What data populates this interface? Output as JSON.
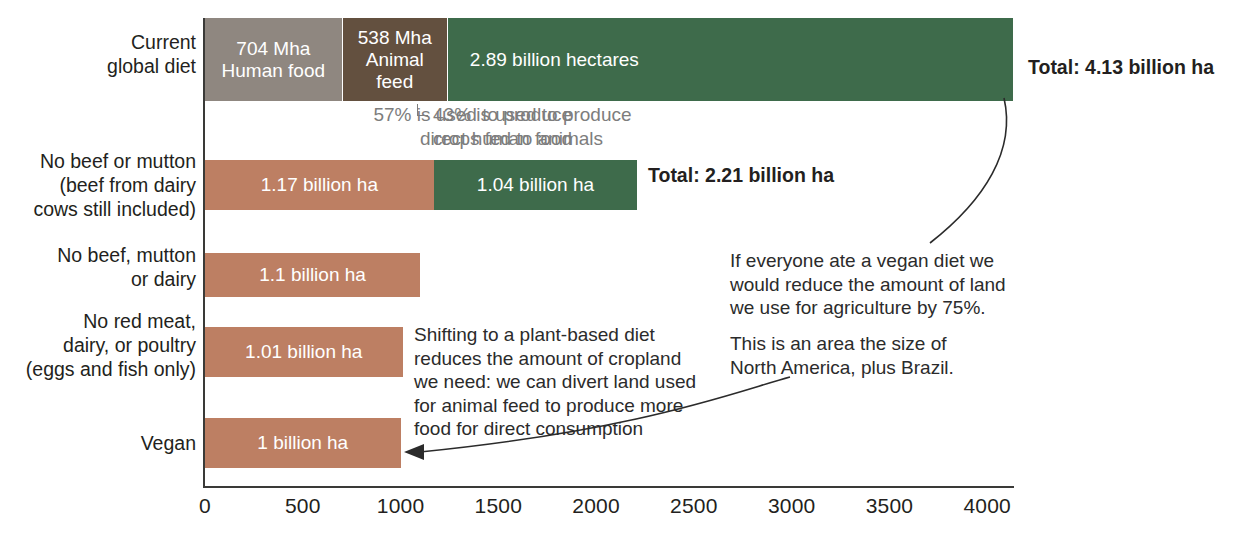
{
  "chart_data": {
    "type": "bar",
    "orientation": "horizontal",
    "stacked": true,
    "title": "",
    "xlabel": "",
    "ylabel": "",
    "xlim": [
      0,
      4150
    ],
    "grid": false,
    "legend": "none",
    "unit": "Mha",
    "categories": [
      "Current\nglobal diet",
      "No beef or mutton\n(beef from dairy\ncows still included)",
      "No beef, mutton\nor dairy",
      "No red meat,\ndairy, or poultry\n(eggs and fish only)",
      "Vegan"
    ],
    "series": [
      {
        "name": "Human food cropland",
        "values": [
          704,
          1170,
          1100,
          1010,
          1000
        ]
      },
      {
        "name": "Animal feed cropland",
        "values": [
          538,
          0,
          0,
          0,
          0
        ]
      },
      {
        "name": "Pasture / grazing land",
        "values": [
          2890,
          1040,
          0,
          0,
          0
        ]
      }
    ],
    "totals": [
      4130,
      2210,
      1100,
      1010,
      1000
    ],
    "tick_labels": [
      "0",
      "500",
      "1000",
      "1500",
      "2000",
      "2500",
      "3000",
      "3500",
      "4000"
    ],
    "tick_values": [
      0,
      500,
      1000,
      1500,
      2000,
      2500,
      3000,
      3500,
      4000
    ]
  },
  "colors": {
    "human_food_grey": "#8f8780",
    "animal_feed_brown": "#63503f",
    "pasture_green": "#3e6b4b",
    "cropland_tan": "#bd7f63",
    "axis": "#3a3a38",
    "grey_text": "#7d7d7d",
    "dark_text": "#231f20",
    "bar_label_text": "#ffffff"
  },
  "bars": [
    {
      "category": "Current\nglobal diet",
      "segments": [
        {
          "label": "704 Mha\nHuman food",
          "value": 704,
          "color": "#8f8780"
        },
        {
          "label": "538 Mha\nAnimal\nfeed",
          "value": 538,
          "color": "#63503f"
        },
        {
          "label": "2.89 billion hectares",
          "value": 2890,
          "color": "#3e6b4b"
        }
      ],
      "total_label": "Total: 4.13 billion ha"
    },
    {
      "category": "No beef or mutton\n(beef from dairy\ncows still included)",
      "segments": [
        {
          "label": "1.17 billion ha",
          "value": 1170,
          "color": "#bd7f63"
        },
        {
          "label": "1.04 billion ha",
          "value": 1040,
          "color": "#3e6b4b"
        }
      ],
      "total_label": "Total: 2.21 billion ha"
    },
    {
      "category": "No beef, mutton\nor dairy",
      "segments": [
        {
          "label": "1.1 billion ha",
          "value": 1100,
          "color": "#bd7f63"
        }
      ],
      "total_label": ""
    },
    {
      "category": "No red meat,\ndairy, or poultry\n(eggs and fish only)",
      "segments": [
        {
          "label": "1.01 billion ha",
          "value": 1010,
          "color": "#bd7f63"
        }
      ],
      "total_label": ""
    },
    {
      "category": "Vegan",
      "segments": [
        {
          "label": "1 billion ha",
          "value": 1000,
          "color": "#bd7f63"
        }
      ],
      "total_label": ""
    }
  ],
  "annotations": {
    "left_share": "57% is used to produce\ndirect human food",
    "right_share": "43% is used to produce\ncrops fed to animals",
    "shift_note": "Shifting to a plant-based diet\nreduces the amount of cropland\nwe need: we can divert land used\nfor animal feed to produce more\nfood for direct consumption",
    "vegan_note": "If everyone ate a vegan diet we\nwould reduce the amount of land\nwe use for agriculture by 75%.",
    "area_note": "This is an area the size of\nNorth America, plus Brazil."
  },
  "axis": {
    "ticks": [
      "0",
      "500",
      "1000",
      "1500",
      "2000",
      "2500",
      "3000",
      "3500",
      "4000"
    ]
  }
}
